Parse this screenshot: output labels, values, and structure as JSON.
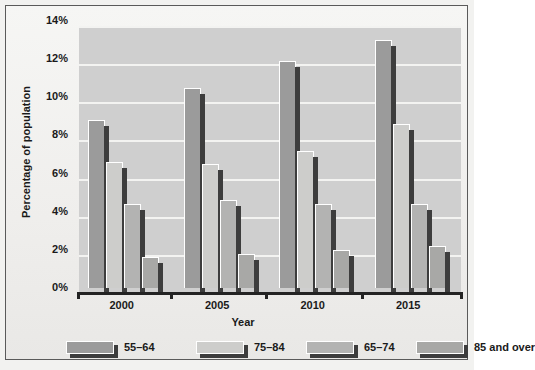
{
  "chart_data": {
    "type": "bar",
    "title": "",
    "xlabel": "Year",
    "ylabel": "Percentage of population",
    "categories": [
      "2000",
      "2005",
      "2010",
      "2015"
    ],
    "series": [
      {
        "name": "55–64",
        "values": [
          8.8,
          10.5,
          11.9,
          13.0
        ],
        "color": "#9b9b9b"
      },
      {
        "name": "75–84",
        "values": [
          6.6,
          6.5,
          7.2,
          8.6
        ],
        "color": "#cdcdcb"
      },
      {
        "name": "65–74",
        "values": [
          4.4,
          4.6,
          4.4,
          4.4
        ],
        "color": "#b3b3b2"
      },
      {
        "name": "85 and over",
        "values": [
          1.6,
          1.8,
          2.0,
          2.2
        ],
        "color": "#a8a8a6"
      }
    ],
    "ylim": [
      0,
      14
    ],
    "ytick_labels": [
      "0%",
      "2%",
      "4%",
      "6%",
      "8%",
      "10%",
      "12%",
      "14%"
    ],
    "ytick_values": [
      0,
      2,
      4,
      6,
      8,
      10,
      12,
      14
    ],
    "grid": true,
    "legend_position": "bottom",
    "plot_background": "#cfcfcf",
    "gridline_color": "#f3f3f1",
    "axis_color": "#232323"
  }
}
